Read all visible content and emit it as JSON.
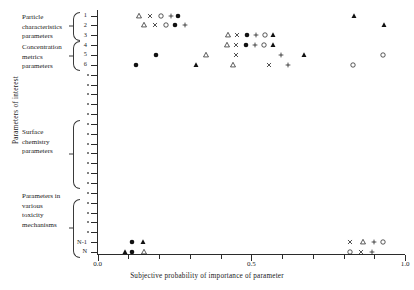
{
  "axes": {
    "ylabel": "Parameters of interest",
    "xlabel": "Subjective probability of importance of parameter",
    "xticklabels": [
      "0.0",
      "0.5",
      "1.0"
    ],
    "xtickvalues": [
      0.0,
      0.5,
      1.0
    ],
    "yticklabels": [
      "1",
      "2",
      "3",
      "4",
      "5",
      "6",
      "N-1",
      "N"
    ]
  },
  "groups": [
    {
      "name": "particle-characteristics",
      "lines": [
        "Particle",
        "characteristics",
        "parameters"
      ]
    },
    {
      "name": "concentration-metrics",
      "lines": [
        "Concentration",
        "metrics",
        "parameters"
      ]
    },
    {
      "name": "surface-chemistry",
      "lines": [
        "Surface",
        "chemistry",
        "parameters"
      ]
    },
    {
      "name": "toxicity-mechanisms",
      "lines": [
        "Parameters in",
        "various",
        "toxicity",
        "mechanisms"
      ]
    }
  ],
  "chart_data": {
    "type": "scatter",
    "title": "",
    "xlabel": "Subjective probability of importance of parameter",
    "ylabel": "Parameters of interest",
    "xlim": [
      0.0,
      1.0
    ],
    "xticks": [
      0.0,
      0.5,
      1.0
    ],
    "grid": false,
    "legend": false,
    "marker_types": [
      "open-triangle",
      "cross-x",
      "open-circle",
      "plus",
      "filled-circle",
      "filled-triangle"
    ],
    "rows": [
      {
        "label": "1",
        "points": [
          {
            "x": 0.135,
            "marker": "open-triangle"
          },
          {
            "x": 0.17,
            "marker": "cross-x"
          },
          {
            "x": 0.205,
            "marker": "open-circle"
          },
          {
            "x": 0.24,
            "marker": "plus"
          },
          {
            "x": 0.262,
            "marker": "filled-circle"
          },
          {
            "x": 0.835,
            "marker": "filled-triangle"
          }
        ]
      },
      {
        "label": "2",
        "points": [
          {
            "x": 0.152,
            "marker": "open-triangle"
          },
          {
            "x": 0.187,
            "marker": "cross-x"
          },
          {
            "x": 0.222,
            "marker": "open-circle"
          },
          {
            "x": 0.253,
            "marker": "filled-circle"
          },
          {
            "x": 0.283,
            "marker": "plus"
          },
          {
            "x": 0.93,
            "marker": "filled-triangle"
          }
        ]
      },
      {
        "label": "3",
        "points": [
          {
            "x": 0.425,
            "marker": "open-triangle"
          },
          {
            "x": 0.455,
            "marker": "cross-x"
          },
          {
            "x": 0.487,
            "marker": "filled-circle"
          },
          {
            "x": 0.515,
            "marker": "plus"
          },
          {
            "x": 0.545,
            "marker": "open-circle"
          },
          {
            "x": 0.572,
            "marker": "filled-triangle"
          }
        ]
      },
      {
        "label": "4",
        "points": [
          {
            "x": 0.42,
            "marker": "open-triangle"
          },
          {
            "x": 0.45,
            "marker": "cross-x"
          },
          {
            "x": 0.482,
            "marker": "filled-circle"
          },
          {
            "x": 0.512,
            "marker": "plus"
          },
          {
            "x": 0.542,
            "marker": "open-circle"
          },
          {
            "x": 0.57,
            "marker": "filled-triangle"
          }
        ]
      },
      {
        "label": "5",
        "points": [
          {
            "x": 0.19,
            "marker": "filled-circle"
          },
          {
            "x": 0.352,
            "marker": "open-triangle"
          },
          {
            "x": 0.45,
            "marker": "cross-x"
          },
          {
            "x": 0.598,
            "marker": "plus"
          },
          {
            "x": 0.67,
            "marker": "filled-triangle"
          },
          {
            "x": 0.928,
            "marker": "open-circle"
          }
        ]
      },
      {
        "label": "6",
        "points": [
          {
            "x": 0.125,
            "marker": "filled-circle"
          },
          {
            "x": 0.32,
            "marker": "filled-triangle"
          },
          {
            "x": 0.44,
            "marker": "open-triangle"
          },
          {
            "x": 0.557,
            "marker": "cross-x"
          },
          {
            "x": 0.62,
            "marker": "plus"
          },
          {
            "x": 0.832,
            "marker": "open-circle"
          }
        ]
      },
      {
        "label": "N-1",
        "points": [
          {
            "x": 0.112,
            "marker": "filled-circle"
          },
          {
            "x": 0.148,
            "marker": "filled-triangle"
          },
          {
            "x": 0.82,
            "marker": "cross-x"
          },
          {
            "x": 0.862,
            "marker": "open-triangle"
          },
          {
            "x": 0.9,
            "marker": "plus"
          },
          {
            "x": 0.928,
            "marker": "open-circle"
          }
        ]
      },
      {
        "label": "N",
        "points": [
          {
            "x": 0.088,
            "marker": "filled-triangle"
          },
          {
            "x": 0.112,
            "marker": "filled-circle"
          },
          {
            "x": 0.15,
            "marker": "open-triangle"
          },
          {
            "x": 0.82,
            "marker": "open-circle"
          },
          {
            "x": 0.858,
            "marker": "cross-x"
          },
          {
            "x": 0.893,
            "marker": "plus"
          }
        ]
      }
    ]
  }
}
